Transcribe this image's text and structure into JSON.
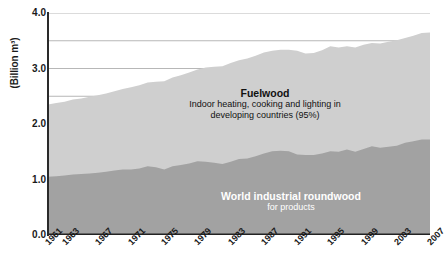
{
  "chart_data": {
    "type": "area",
    "stacked": true,
    "title": "",
    "subtitle": "",
    "xlabel": "",
    "ylabel": "(Billion m³)",
    "ylim": [
      0.0,
      4.0
    ],
    "yticks": [
      "0.0",
      "1.0",
      "2.0",
      "3.0",
      "4.0"
    ],
    "ytick_values": [
      0.0,
      1.0,
      2.0,
      3.0,
      4.0
    ],
    "gridlines": [
      2.5,
      3.0,
      3.5,
      4.0
    ],
    "grid": true,
    "legend": "none",
    "xtick_labels": [
      "1961",
      "1963",
      "1967",
      "1971",
      "1975",
      "1979",
      "1983",
      "1987",
      "1991",
      "1995",
      "1999",
      "2003",
      "2007"
    ],
    "xtick_values": [
      1961,
      1963,
      1967,
      1971,
      1975,
      1979,
      1983,
      1987,
      1991,
      1995,
      1999,
      2003,
      2007
    ],
    "x": [
      1961,
      1962,
      1963,
      1964,
      1965,
      1966,
      1967,
      1968,
      1969,
      1970,
      1971,
      1972,
      1973,
      1974,
      1975,
      1976,
      1977,
      1978,
      1979,
      1980,
      1981,
      1982,
      1983,
      1984,
      1985,
      1986,
      1987,
      1988,
      1989,
      1990,
      1991,
      1992,
      1993,
      1994,
      1995,
      1996,
      1997,
      1998,
      1999,
      2000,
      2001,
      2002,
      2003,
      2004,
      2005,
      2006,
      2007
    ],
    "series": [
      {
        "name": "World industrial roundwood",
        "sublabel": "for products",
        "color": "#a2a2a2",
        "values": [
          1.05,
          1.06,
          1.07,
          1.09,
          1.1,
          1.11,
          1.12,
          1.14,
          1.16,
          1.18,
          1.18,
          1.2,
          1.24,
          1.22,
          1.18,
          1.24,
          1.26,
          1.29,
          1.33,
          1.32,
          1.3,
          1.28,
          1.32,
          1.37,
          1.38,
          1.42,
          1.47,
          1.51,
          1.52,
          1.51,
          1.45,
          1.44,
          1.44,
          1.47,
          1.51,
          1.5,
          1.54,
          1.5,
          1.55,
          1.6,
          1.57,
          1.59,
          1.61,
          1.66,
          1.69,
          1.72,
          1.72
        ]
      },
      {
        "name": "Fuelwood",
        "sublabel": "Indoor heating, cooking and lighting in developing countries (95%)",
        "color": "#cfcfcf",
        "values": [
          1.3,
          1.32,
          1.33,
          1.35,
          1.36,
          1.38,
          1.4,
          1.41,
          1.43,
          1.45,
          1.48,
          1.5,
          1.51,
          1.54,
          1.59,
          1.6,
          1.62,
          1.64,
          1.65,
          1.7,
          1.73,
          1.76,
          1.78,
          1.78,
          1.8,
          1.81,
          1.82,
          1.81,
          1.82,
          1.83,
          1.87,
          1.83,
          1.84,
          1.86,
          1.89,
          1.88,
          1.86,
          1.88,
          1.88,
          1.86,
          1.88,
          1.89,
          1.9,
          1.89,
          1.9,
          1.92,
          1.93
        ]
      }
    ],
    "totals": [
      2.35,
      2.38,
      2.4,
      2.44,
      2.46,
      2.49,
      2.52,
      2.55,
      2.59,
      2.63,
      2.66,
      2.7,
      2.75,
      2.76,
      2.77,
      2.84,
      2.88,
      2.93,
      2.98,
      3.02,
      3.03,
      3.04,
      3.1,
      3.15,
      3.18,
      3.23,
      3.29,
      3.32,
      3.34,
      3.34,
      3.32,
      3.27,
      3.28,
      3.33,
      3.4,
      3.38,
      3.4,
      3.38,
      3.43,
      3.46,
      3.45,
      3.48,
      3.51,
      3.55,
      3.59,
      3.64,
      3.65
    ]
  },
  "annotations": {
    "fuelwood": {
      "title": "Fuelwood",
      "line1": "Indoor heating, cooking and lighting in",
      "line2": "developing countries (95%)"
    },
    "roundwood": {
      "title": "World industrial roundwood",
      "line1": "for products"
    }
  },
  "axis": {
    "y_axis_label": "(Billion m³)"
  }
}
